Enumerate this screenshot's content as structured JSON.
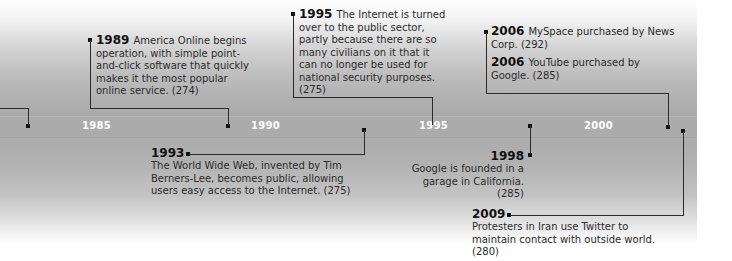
{
  "timeline": {
    "axis_ticks": [
      "1985",
      "1990",
      "1995",
      "2000"
    ],
    "events": [
      {
        "year": "1989",
        "text": "America Online begins operation, with simple point-and-click software that quickly makes it the most popular online service. (274)"
      },
      {
        "year": "1993",
        "text": "The World Wide Web, invented by Tim Berners-Lee, becomes public, allowing users easy access to the Internet. (275)"
      },
      {
        "year": "1995",
        "text": "The Internet is turned over to the public sector, partly because there are so many civilians on it that it can no longer be used for national security purposes. (275)"
      },
      {
        "year": "1998",
        "text": "Google is founded in a garage in California. (285)"
      },
      {
        "year": "2006",
        "text": "MySpace purchased by News Corp. (292)"
      },
      {
        "year": "2006",
        "text": "YouTube purchased by Google. (285)"
      },
      {
        "year": "2009",
        "text": "Protesters in Iran use Twitter to maintain contact with outside world. (280)"
      }
    ]
  },
  "colors": {
    "band": "#ababab",
    "tick_label": "#ffffff",
    "connector": "#2a2a2a",
    "text": "#2b2b2b"
  }
}
